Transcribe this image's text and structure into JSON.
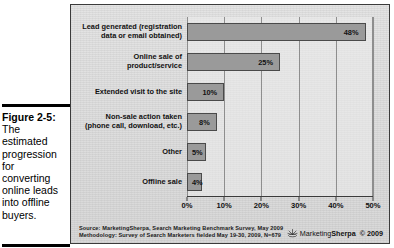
{
  "caption": {
    "figure_label": "Figure 2-5:",
    "lines": [
      "The",
      "estimated",
      "progression",
      "for",
      "converting",
      "online leads",
      "into offline",
      "buyers."
    ]
  },
  "footer": {
    "source_line1": "Source: MarketingSherpa, Search Marketing Benchmark Survey, May 2009",
    "source_line2": "Methodology: Survey of Search Marketers fielded May 19-30, 2009, N=679",
    "logo_light": "Marketing",
    "logo_bold": "Sherpa",
    "copyright": "© 2009",
    "logo_icon": "sunburst-icon"
  },
  "chart_data": {
    "type": "bar",
    "orientation": "horizontal",
    "title": "",
    "subtitle": "",
    "xlabel": "",
    "ylabel": "",
    "xlim": [
      0,
      50
    ],
    "grid": true,
    "legend": false,
    "bar_color": "#9a9a9a",
    "categories": [
      "Lead generated (registration data or email obtained)",
      "Online sale of product/service",
      "Extended visit to the site",
      "Non-sale action taken (phone call, download, etc.)",
      "Other",
      "Offline sale"
    ],
    "category_lines": [
      [
        "Lead generated (registration",
        "data or email obtained)"
      ],
      [
        "Online sale of",
        "product/service"
      ],
      [
        "Extended visit to the site"
      ],
      [
        "Non-sale action taken",
        "(phone call, download, etc.)"
      ],
      [
        "Other"
      ],
      [
        "Offline sale"
      ]
    ],
    "values": [
      48,
      25,
      10,
      8,
      5,
      4
    ],
    "value_labels": [
      "48%",
      "25%",
      "10%",
      "8%",
      "5%",
      "4%"
    ],
    "ticks": [
      0,
      10,
      20,
      30,
      40,
      50
    ],
    "tick_labels": [
      "0%",
      "10%",
      "20%",
      "30%",
      "40%",
      "50%"
    ]
  }
}
